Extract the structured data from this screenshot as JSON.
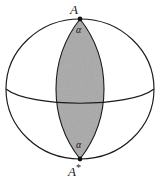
{
  "figure": {
    "background_color": "#ffffff",
    "stroke_color": "#1a1a1a",
    "lune_fill_color": "#a8a8a8",
    "vertex_marker_color": "#111111",
    "labels": {
      "north_pole": "A",
      "north_pole_superscript": "",
      "south_pole": "A",
      "south_pole_superscript": "*",
      "angle_north": "α",
      "angle_south": "α"
    },
    "geometry": {
      "sphere_center_x": 80,
      "sphere_center_y": 89,
      "sphere_radius_x": 74,
      "sphere_radius_y": 70,
      "north_pole_x": 80,
      "north_pole_y": 19,
      "south_pole_x": 80,
      "south_pole_y": 159,
      "lune_half_width": 24,
      "equator_sagitta": 14,
      "vertex_marker_radius": 2.4,
      "stroke_width": 1.1
    }
  }
}
